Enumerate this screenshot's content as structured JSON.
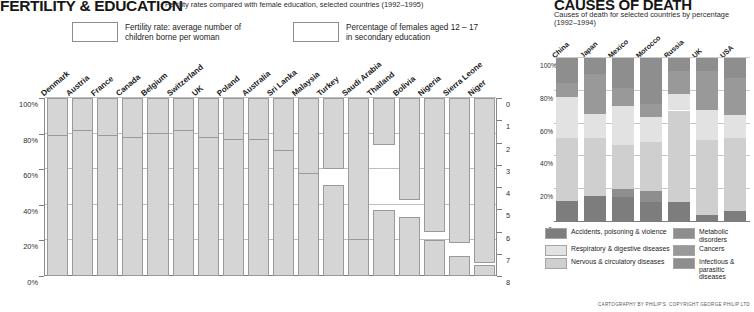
{
  "left": {
    "title": "FERTILITY & EDUCATION",
    "subtitle": "Fertility rates compared with female education, selected countries (1992–1995)",
    "legend": [
      {
        "id": "fertility-rate",
        "label": "Fertility rate: average number of\nchildren borne per woman",
        "color": "#d5d5d5"
      },
      {
        "id": "female-secondary-education",
        "label": "Percentage of females aged 12 – 17\nin secondary education",
        "color": "#d5d5d5"
      }
    ],
    "axis_left_ticks": [
      "100%",
      "80%",
      "60%",
      "40%",
      "20%",
      "0%"
    ],
    "axis_right_ticks": [
      "0",
      "1",
      "2",
      "3",
      "4",
      "5",
      "6",
      "7",
      "8"
    ]
  },
  "right": {
    "title": "CAUSES OF DEATH",
    "subtitle_line1": "Causes of death for selected countries by percentage",
    "subtitle_line2": "(1992–1994)",
    "axis_ticks": [
      "100%",
      "80%",
      "60%",
      "40%",
      "20%",
      "0"
    ],
    "legend": [
      {
        "id": "accidents-poisoning-violence",
        "label": "Accidents, poisoning & violence",
        "color": "#7d7d7d"
      },
      {
        "id": "metabolic-disorders",
        "label": "Metabolic disorders",
        "color": "#8e8e8e"
      },
      {
        "id": "respiratory-digestive-diseases",
        "label": "Respiratory & digestive diseases",
        "color": "#e2e2e2"
      },
      {
        "id": "cancers",
        "label": "Cancers",
        "color": "#999999"
      },
      {
        "id": "nervous-circulatory-diseases",
        "label": "Nervous & circulatory diseases",
        "color": "#cfcfcf"
      },
      {
        "id": "infectious-parasitic-diseases",
        "label": "Infectious & parasitic\ndiseases",
        "color": "#8e8e8e"
      }
    ]
  },
  "credit": "CARTOGRAPHY BY PHILIP'S. COPYRIGHT GEORGE PHILIP LTD",
  "chart_data": [
    {
      "type": "bar",
      "id": "fertility-education",
      "title": "FERTILITY & EDUCATION",
      "subtitle": "Fertility rates compared with female education, selected countries (1992–1995)",
      "xlabel": "",
      "ylabel_left": "Percentage of females aged 12–17 in secondary education",
      "ylabel_right": "Fertility rate: average number of children borne per woman",
      "ylim_left": [
        0,
        100
      ],
      "ylim_right": [
        0,
        8
      ],
      "right_axis_inverted": true,
      "grid": true,
      "categories": [
        "Denmark",
        "Austria",
        "France",
        "Canada",
        "Belgium",
        "Switzerland",
        "UK",
        "Poland",
        "Australia",
        "Sri Lanka",
        "Malaysia",
        "Turkey",
        "Saudi Arabia",
        "Thailand",
        "Bolivia",
        "Nigeria",
        "Sierra Leone",
        "Niger"
      ],
      "series": [
        {
          "name": "Percentage of females aged 12 – 17 in secondary education",
          "unit": "%",
          "values": [
            100,
            100,
            100,
            100,
            100,
            100,
            90,
            90,
            85,
            74,
            60,
            51,
            45,
            37,
            33,
            20,
            11,
            6
          ]
        },
        {
          "name": "Fertility rate: average number of children borne per woman",
          "unit": "children",
          "values": [
            1.7,
            1.5,
            1.7,
            1.8,
            1.6,
            1.5,
            1.8,
            1.9,
            1.9,
            2.4,
            3.4,
            3.2,
            6.4,
            2.1,
            4.6,
            6.0,
            6.5,
            7.4
          ]
        }
      ]
    },
    {
      "type": "bar",
      "id": "causes-of-death",
      "subtype": "stacked-100",
      "title": "CAUSES OF DEATH",
      "subtitle": "Causes of death for selected countries by percentage (1992–1994)",
      "ylabel": "Percentage",
      "ylim": [
        0,
        100
      ],
      "grid": true,
      "categories": [
        "China",
        "Japan",
        "Mexico",
        "Morocco",
        "Russia",
        "UK",
        "USA"
      ],
      "series": [
        {
          "name": "Accidents, poisoning & violence",
          "color": "#7d7d7d",
          "values": [
            13,
            16,
            15,
            12,
            12,
            4,
            7
          ]
        },
        {
          "name": "Infectious & parasitic diseases",
          "color": "#8e8e8e",
          "values": [
            0,
            0,
            5,
            7,
            0,
            0,
            0
          ]
        },
        {
          "name": "Nervous & circulatory diseases",
          "color": "#cfcfcf",
          "values": [
            38,
            35,
            27,
            30,
            56,
            46,
            44
          ]
        },
        {
          "name": "Respiratory & digestive diseases",
          "color": "#e2e2e2",
          "values": [
            25,
            15,
            24,
            15,
            10,
            18,
            14
          ]
        },
        {
          "name": "Cancers",
          "color": "#999999",
          "values": [
            9,
            24,
            11,
            8,
            14,
            24,
            23
          ]
        },
        {
          "name": "Metabolic disorders",
          "color": "#8e8e8e",
          "values": [
            15,
            10,
            18,
            28,
            8,
            8,
            12
          ]
        }
      ]
    }
  ]
}
